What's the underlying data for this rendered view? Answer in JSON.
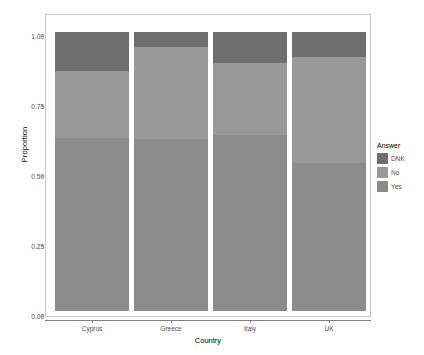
{
  "chart_data": {
    "type": "bar",
    "stacked": true,
    "stack_normalized": true,
    "title": "",
    "xlabel": "Country",
    "ylabel": "Proportion",
    "categories": [
      "Cyprus",
      "Greece",
      "Italy",
      "UK"
    ],
    "ylim": [
      0.0,
      1.0
    ],
    "yticks": [
      0.0,
      0.25,
      0.5,
      0.75,
      1.0
    ],
    "ytick_labels": [
      "0.00",
      "0.25",
      "0.50",
      "0.75",
      "1.00"
    ],
    "grid": false,
    "legend_title": "Answer",
    "legend_position": "right",
    "legend_order": [
      "DNK",
      "No",
      "Yes"
    ],
    "series": [
      {
        "name": "Yes",
        "color": "#8c8c8c",
        "values": [
          0.62,
          0.615,
          0.63,
          0.53
        ]
      },
      {
        "name": "No",
        "color": "#989898",
        "values": [
          0.24,
          0.33,
          0.26,
          0.38
        ]
      },
      {
        "name": "DNK",
        "color": "#6e6e6e",
        "values": [
          0.14,
          0.055,
          0.11,
          0.09
        ]
      }
    ],
    "colors": {
      "dnk": "#6e6e6e",
      "no": "#989898",
      "yes": "#8c8c8c",
      "panel_border": "#c9c9c9",
      "axis": "#808080",
      "tick_text": "#4d4d4d",
      "axis_title": "#000000",
      "background": "#ffffff"
    }
  }
}
